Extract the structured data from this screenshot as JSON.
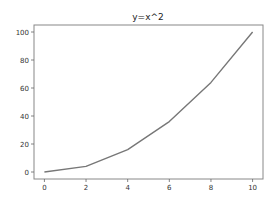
{
  "chart_data": {
    "type": "line",
    "title": "y=x^2",
    "xlabel": "",
    "ylabel": "",
    "x": [
      0,
      1,
      2,
      3,
      4,
      5,
      6,
      7,
      8,
      9,
      10
    ],
    "series": [
      {
        "name": "y=x^2",
        "values": [
          0,
          1,
          4,
          9,
          16,
          25,
          36,
          49,
          64,
          81,
          100
        ],
        "color": "#777777"
      }
    ],
    "x_plotted": [
      0,
      2,
      4,
      6,
      8,
      10
    ],
    "y_plotted": [
      0,
      4,
      16,
      36,
      64,
      100
    ],
    "xticks": [
      0,
      2,
      4,
      6,
      8,
      10
    ],
    "yticks": [
      0,
      20,
      40,
      60,
      80,
      100
    ],
    "xlim": [
      -0.5,
      10.5
    ],
    "ylim": [
      -5,
      105
    ],
    "grid": false,
    "legend": null
  }
}
